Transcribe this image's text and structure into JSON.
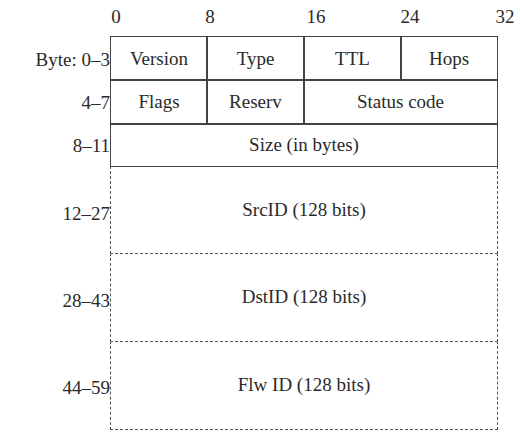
{
  "bit_ticks": [
    "0",
    "8",
    "16",
    "24",
    "32"
  ],
  "rows": [
    {
      "label": "Byte: 0–3",
      "fields": [
        "Version",
        "Type",
        "TTL",
        "Hops"
      ]
    },
    {
      "label": "4–7",
      "fields": [
        "Flags",
        "Reserv",
        "Status code"
      ]
    },
    {
      "label": "8–11",
      "fields": [
        "Size (in bytes)"
      ]
    },
    {
      "label": "12–27",
      "fields": [
        "SrcID (128 bits)"
      ]
    },
    {
      "label": "28–43",
      "fields": [
        "DstID (128 bits)"
      ]
    },
    {
      "label": "44–59",
      "fields": [
        "Flw ID (128 bits)"
      ]
    }
  ]
}
